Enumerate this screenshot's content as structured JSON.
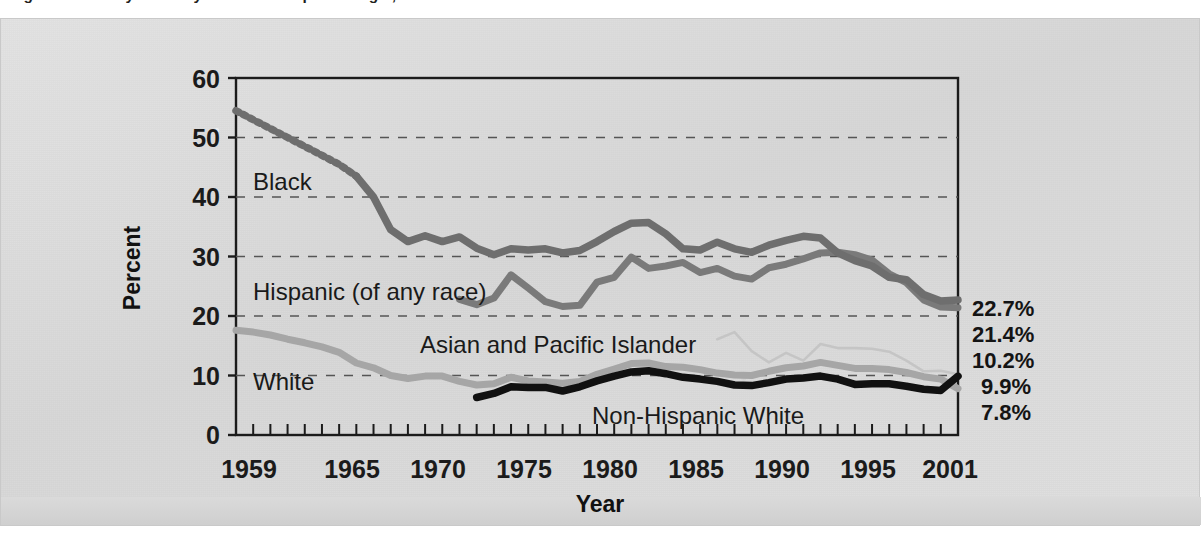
{
  "figure": {
    "title": "Figure 1.  Poverty Rates by Race and Hispanic Origin, 1959 to 2001",
    "title_note": "clipped at top edge of scan"
  },
  "axes": {
    "y_title": "Percent",
    "x_title": "Year",
    "y_ticks": [
      "0",
      "10",
      "20",
      "30",
      "40",
      "50",
      "60"
    ],
    "x_ticks": [
      "1959",
      "1965",
      "1970",
      "1975",
      "1980",
      "1985",
      "1990",
      "1995",
      "2001"
    ]
  },
  "series_labels": {
    "black": "Black",
    "hispanic": "Hispanic (of any race)",
    "asian": "Asian and Pacific Islander",
    "white": "White",
    "non_hispanic_white": "Non-Hispanic White"
  },
  "end_labels": [
    "22.7%",
    "21.4%",
    "10.2%",
    "9.9%",
    "7.8%"
  ],
  "colors": {
    "black_series": "#6e6e6e",
    "hispanic_series": "#7a7a7a",
    "asian_series": "#c5c5c5",
    "white_series": "#a6a6a6",
    "non_hispanic_white_series": "#111111",
    "grid": "#555555",
    "axis": "#1b1b1b",
    "panel_bg": "#dcdcdc"
  },
  "chart_data": {
    "type": "line",
    "title": "Poverty Rates by Race and Hispanic Origin, 1959 to 2001",
    "xlabel": "Year",
    "ylabel": "Percent",
    "xlim": [
      1959,
      2001
    ],
    "ylim": [
      0,
      60
    ],
    "ytick_values": [
      0,
      10,
      20,
      30,
      40,
      50,
      60
    ],
    "xtick_values": [
      1959,
      1965,
      1970,
      1975,
      1980,
      1985,
      1990,
      1995,
      2001
    ],
    "grid": "horizontal-dashed",
    "legend": "inline-labels",
    "annotations": [
      {
        "text": "22.7%",
        "series": "Black",
        "year": 2001
      },
      {
        "text": "21.4%",
        "series": "Hispanic (of any race)",
        "year": 2001
      },
      {
        "text": "10.2%",
        "series": "Asian and Pacific Islander",
        "year": 2001
      },
      {
        "text": "9.9%",
        "series": "Non-Hispanic White",
        "year": 2001
      },
      {
        "text": "7.8%",
        "series": "White",
        "year": 2001
      }
    ],
    "series": [
      {
        "name": "Black",
        "color": "#6e6e6e",
        "style": "dotted-then-solid",
        "x": [
          1959,
          1960,
          1961,
          1962,
          1963,
          1964,
          1965,
          1966,
          1967,
          1968,
          1969,
          1970,
          1971,
          1972,
          1973,
          1974,
          1975,
          1976,
          1977,
          1978,
          1979,
          1980,
          1981,
          1982,
          1983,
          1984,
          1985,
          1986,
          1987,
          1988,
          1989,
          1990,
          1991,
          1992,
          1993,
          1994,
          1995,
          1996,
          1997,
          1998,
          1999,
          2000,
          2001
        ],
        "values": [
          54.5,
          53.0,
          51.5,
          50.0,
          48.5,
          47.0,
          45.5,
          43.5,
          40.0,
          34.5,
          32.5,
          33.5,
          32.5,
          33.3,
          31.4,
          30.3,
          31.3,
          31.1,
          31.3,
          30.6,
          31.0,
          32.5,
          34.2,
          35.6,
          35.7,
          33.8,
          31.3,
          31.1,
          32.4,
          31.3,
          30.7,
          31.9,
          32.7,
          33.4,
          33.1,
          30.6,
          29.3,
          28.4,
          26.5,
          26.1,
          23.6,
          22.5,
          22.7
        ]
      },
      {
        "name": "Hispanic (of any race)",
        "color": "#7a7a7a",
        "style": "solid",
        "x": [
          1972,
          1973,
          1974,
          1975,
          1976,
          1977,
          1978,
          1979,
          1980,
          1981,
          1982,
          1983,
          1984,
          1985,
          1986,
          1987,
          1988,
          1989,
          1990,
          1991,
          1992,
          1993,
          1994,
          1995,
          1996,
          1997,
          1998,
          1999,
          2000,
          2001
        ],
        "values": [
          22.8,
          21.9,
          23.0,
          26.9,
          24.7,
          22.4,
          21.6,
          21.8,
          25.7,
          26.5,
          29.9,
          28.0,
          28.4,
          29.0,
          27.3,
          28.0,
          26.7,
          26.2,
          28.1,
          28.7,
          29.6,
          30.6,
          30.7,
          30.3,
          29.4,
          27.1,
          25.6,
          22.7,
          21.5,
          21.4
        ]
      },
      {
        "name": "Asian and Pacific Islander",
        "color": "#c5c5c5",
        "style": "thin-solid",
        "x": [
          1987,
          1988,
          1989,
          1990,
          1991,
          1992,
          1993,
          1994,
          1995,
          1996,
          1997,
          1998,
          1999,
          2000,
          2001
        ],
        "values": [
          16.1,
          17.3,
          14.1,
          12.2,
          13.8,
          12.5,
          15.3,
          14.6,
          14.6,
          14.5,
          14.0,
          12.5,
          10.7,
          10.8,
          10.2
        ]
      },
      {
        "name": "Non-Hispanic White",
        "color": "#111111",
        "style": "bold-solid",
        "x": [
          1973,
          1974,
          1975,
          1976,
          1977,
          1978,
          1979,
          1980,
          1981,
          1982,
          1983,
          1984,
          1985,
          1986,
          1987,
          1988,
          1989,
          1990,
          1991,
          1992,
          1993,
          1994,
          1995,
          1996,
          1997,
          1998,
          1999,
          2000,
          2001
        ],
        "values": [
          6.3,
          7.0,
          8.1,
          8.0,
          8.0,
          7.4,
          8.1,
          9.1,
          9.9,
          10.6,
          10.8,
          10.3,
          9.7,
          9.4,
          9.0,
          8.4,
          8.3,
          8.8,
          9.4,
          9.6,
          9.9,
          9.4,
          8.5,
          8.6,
          8.6,
          8.2,
          7.7,
          7.5,
          9.9
        ]
      },
      {
        "name": "White",
        "color": "#a6a6a6",
        "style": "solid",
        "x": [
          1959,
          1960,
          1961,
          1962,
          1963,
          1964,
          1965,
          1966,
          1967,
          1968,
          1969,
          1970,
          1971,
          1972,
          1973,
          1974,
          1975,
          1976,
          1977,
          1978,
          1979,
          1980,
          1981,
          1982,
          1983,
          1984,
          1985,
          1986,
          1987,
          1988,
          1989,
          1990,
          1991,
          1992,
          1993,
          1994,
          1995,
          1996,
          1997,
          1998,
          1999,
          2000,
          2001
        ],
        "values": [
          17.6,
          17.3,
          16.8,
          16.1,
          15.5,
          14.8,
          13.9,
          12.1,
          11.3,
          10.0,
          9.5,
          9.9,
          9.9,
          9.0,
          8.4,
          8.6,
          9.7,
          9.1,
          8.9,
          8.7,
          9.0,
          10.2,
          11.1,
          12.0,
          12.1,
          11.5,
          11.4,
          11.0,
          10.4,
          10.1,
          10.0,
          10.7,
          11.3,
          11.6,
          12.2,
          11.7,
          11.2,
          11.2,
          11.0,
          10.5,
          9.8,
          9.4,
          7.8
        ]
      }
    ]
  }
}
